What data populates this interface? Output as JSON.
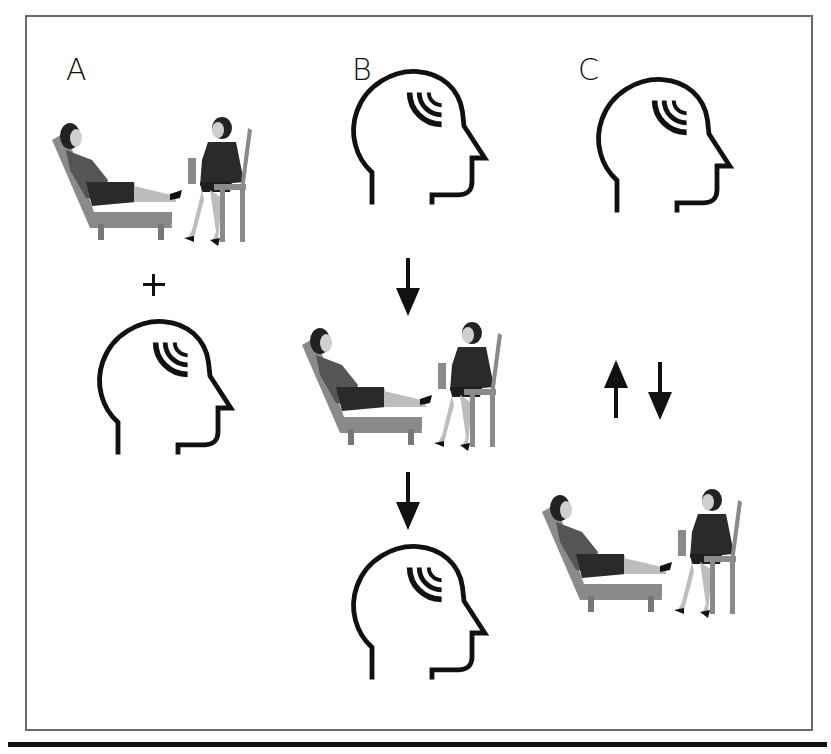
{
  "panels": [
    {
      "label": "A",
      "description": "Therapy session plus mind (head icon)",
      "operator": "+"
    },
    {
      "label": "B",
      "description": "Mind -> therapy session -> mind (sequential)"
    },
    {
      "label": "C",
      "description": "Mind <-> therapy session (bidirectional)"
    }
  ],
  "icons": {
    "head": "head-profile-with-waves-icon",
    "scene": "therapy-session-couch-and-chair-illustration",
    "arrow_down": "arrow-down-icon",
    "arrow_up": "arrow-up-icon",
    "plus": "plus-icon"
  },
  "colors": {
    "stroke": "#111111",
    "frame": "#6a6a6a",
    "couch": "#8a8a8a",
    "dress": "#2a2a2a",
    "skin": "#cfcfcf"
  }
}
